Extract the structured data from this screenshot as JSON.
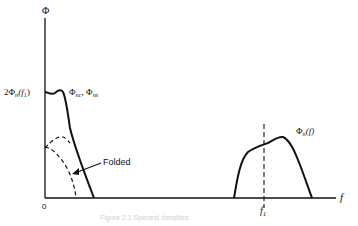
{
  "labels": {
    "y_axis": "Φ",
    "x_axis": "f",
    "origin": "0",
    "y_level": {
      "prefix": "2Φ",
      "sub": "n",
      "arg": "(f",
      "arg_sub": "1",
      "close": ")"
    },
    "lowpass_curve": {
      "a": "Φ",
      "a_sub": "nc",
      "sep": ", ",
      "b": "Φ",
      "b_sub": "ns"
    },
    "bandpass_curve": {
      "main": "Φ",
      "sub": "n",
      "arg": "(f)"
    },
    "folded": "Folded",
    "center_freq": {
      "main": "f",
      "sub": "1"
    },
    "caption": "Figure 2.1  Spectral densities"
  },
  "colors": {
    "ink": "#111111",
    "background": "#ffffff"
  }
}
